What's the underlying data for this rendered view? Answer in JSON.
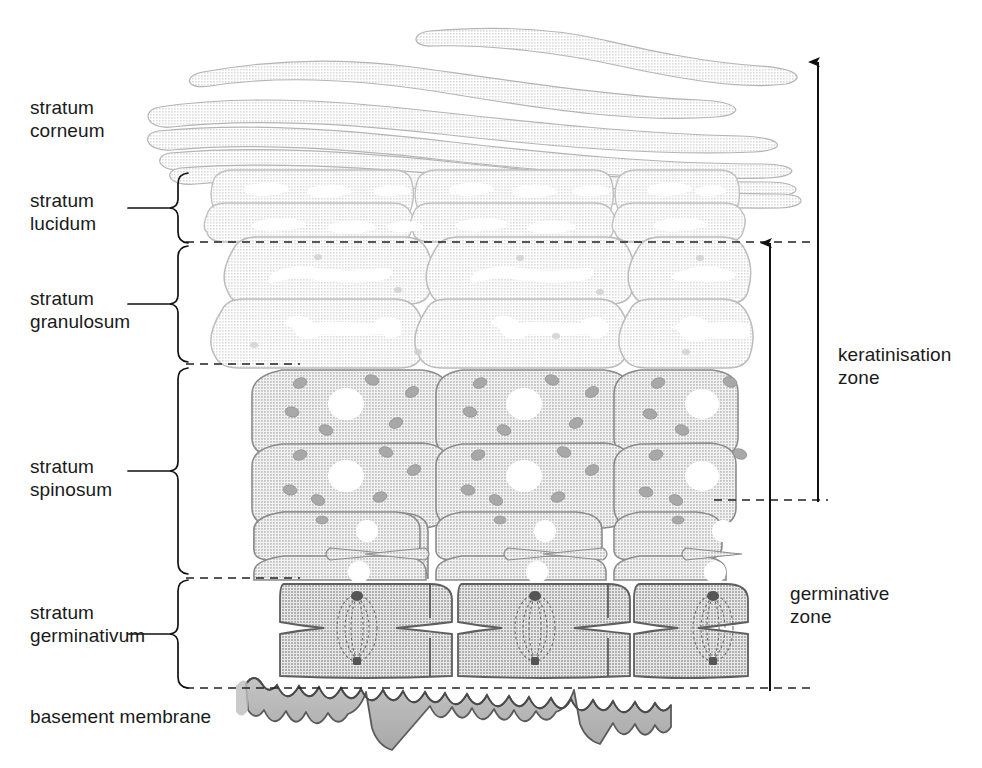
{
  "diagram": {
    "type": "anatomical-cross-section",
    "background_color": "#ffffff",
    "ink_color": "#1a1a1a"
  },
  "layer_labels": [
    {
      "id": "corneum",
      "text": "stratum\ncorneum",
      "x": 30,
      "y": 96,
      "has_brace": false,
      "has_leader": false
    },
    {
      "id": "lucidum",
      "text": "stratum\nlucidum",
      "x": 30,
      "y": 189,
      "has_brace": true,
      "has_leader": true
    },
    {
      "id": "granulosum",
      "text": "stratum\ngranulosum",
      "x": 30,
      "y": 287,
      "has_brace": true,
      "has_leader": true
    },
    {
      "id": "spinosum",
      "text": "stratum\nspinosum",
      "x": 30,
      "y": 455,
      "has_brace": true,
      "has_leader": true
    },
    {
      "id": "germinativum",
      "text": "stratum\ngerminativum",
      "x": 30,
      "y": 601,
      "has_brace": true,
      "has_leader": true
    },
    {
      "id": "basement",
      "text": "basement membrane",
      "x": 30,
      "y": 705,
      "has_brace": false,
      "has_leader": false
    }
  ],
  "zone_labels": [
    {
      "id": "keratinisation",
      "text": "keratinisation\nzone",
      "x": 838,
      "y": 343
    },
    {
      "id": "germinative",
      "text": "germinative\nzone",
      "x": 790,
      "y": 582
    }
  ],
  "zone_arrows": [
    {
      "id": "keratinisation-arrow",
      "x": 818,
      "top": 62,
      "bottom": 502,
      "arrowhead": "up"
    },
    {
      "id": "germinative-arrow",
      "x": 770,
      "top": 243,
      "bottom": 691,
      "arrowhead": "up"
    }
  ],
  "braces": [
    {
      "id": "brace-lucidum",
      "top": 173,
      "bottom": 243,
      "x": 195,
      "leader_y": 208,
      "leader_x1": 128,
      "leader_x2": 190
    },
    {
      "id": "brace-granulosum",
      "top": 246,
      "bottom": 362,
      "x": 195,
      "leader_y": 304,
      "leader_x1": 128,
      "leader_x2": 190
    },
    {
      "id": "brace-spinosum",
      "top": 368,
      "bottom": 575,
      "x": 195,
      "leader_y": 471,
      "leader_x1": 128,
      "leader_x2": 190
    },
    {
      "id": "brace-germinativum",
      "top": 580,
      "bottom": 688,
      "x": 195,
      "leader_y": 634,
      "leader_x1": 128,
      "leader_x2": 190
    }
  ],
  "dashed_boundaries": [
    {
      "id": "boundary-lucidum-granulosum",
      "y": 242,
      "x1": 186,
      "x2": 812
    },
    {
      "id": "boundary-granulosum-spinosum",
      "y": 364,
      "x1": 186,
      "x2": 300
    },
    {
      "id": "boundary-spinosum-upper",
      "y": 500,
      "x1": 714,
      "x2": 828
    },
    {
      "id": "boundary-spinosum-lower",
      "y": 578,
      "x1": 186,
      "x2": 300
    },
    {
      "id": "boundary-germinativum-base",
      "y": 688,
      "x1": 186,
      "x2": 812
    }
  ],
  "cell_layers": [
    {
      "id": "stratum-corneum",
      "rows": 6,
      "style": "flattened-wavy-strands",
      "fill": "#d9d9d9",
      "stroke": "#b8b8b8",
      "nuclei": "none"
    },
    {
      "id": "stratum-lucidum",
      "rows": 2,
      "style": "flattened-blocks",
      "fill": "#e2e2e2",
      "stroke": "#c2c2c2",
      "nuclei": "slit-white"
    },
    {
      "id": "stratum-granulosum",
      "rows": 2,
      "style": "flattened-blocks",
      "fill": "#e0e0e0",
      "stroke": "#bdbdbd",
      "nuclei": "irregular-white"
    },
    {
      "id": "stratum-spinosum",
      "rows": 4,
      "style": "polygonal-blocks",
      "fill": "#c9c9c9",
      "stroke": "#8f8f8f",
      "nuclei": "round-white",
      "granules": true
    },
    {
      "id": "stratum-germinativum",
      "rows": 1,
      "style": "columnar-blocks",
      "fill": "#bdbdbd",
      "stroke": "#6b6b6b",
      "nuclei": "mitotic-spindle"
    },
    {
      "id": "basement-membrane",
      "rows": 1,
      "style": "wavy-band",
      "fill": "#b5b5b5",
      "stroke": "#5e5e5e",
      "nuclei": "none"
    }
  ],
  "columns": 3
}
